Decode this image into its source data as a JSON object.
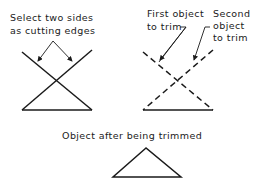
{
  "labels": {
    "cutting_edges_line1": "Select two sides",
    "cutting_edges_line2": "as cutting edges",
    "first_object_line1": "First object",
    "first_object_line2": "to trim",
    "second_object_line1": "Second",
    "second_object_line2": "object",
    "second_object_line3": "to trim",
    "result_caption": "Object after being trimmed"
  },
  "colors": {
    "stroke": "#1a1a1a",
    "background": "#ffffff"
  }
}
